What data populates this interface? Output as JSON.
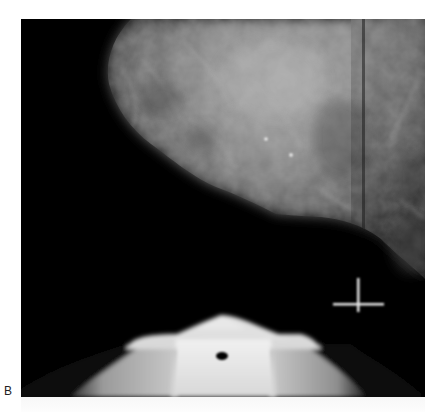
{
  "figure": {
    "panel_label": "B",
    "image_type": "mammogram spot compression view",
    "background_color": "#000000",
    "page_background": "#ffffff",
    "tissue_color": "#8a8a8a",
    "paddle_color": "#e6e6e6"
  },
  "annotations": {
    "crosshair": {
      "x": 358,
      "y": 304
    },
    "calcifications": [
      {
        "x": 266,
        "y": 139
      },
      {
        "x": 291,
        "y": 155
      }
    ],
    "paddle_hole": {
      "x": 222,
      "y": 356
    }
  }
}
